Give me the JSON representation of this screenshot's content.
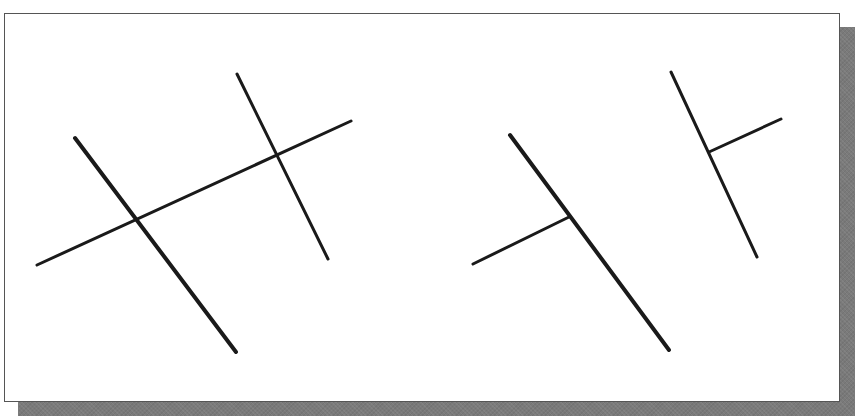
{
  "diagram": {
    "colors": {
      "line": "#1a1a1a",
      "frame_border": "#555555",
      "shadow": "#7a7a7a",
      "background": "#ffffff"
    },
    "left_figure": {
      "lines": [
        {
          "id": "thick-diagonal",
          "x1": 75,
          "y1": 138,
          "x2": 236,
          "y2": 352,
          "width": 4
        },
        {
          "id": "long-shallow",
          "x1": 37,
          "y1": 265,
          "x2": 351,
          "y2": 121,
          "width": 3
        },
        {
          "id": "short-diagonal",
          "x1": 237,
          "y1": 74,
          "x2": 328,
          "y2": 259,
          "width": 3
        }
      ],
      "intersections": [
        {
          "x": 135,
          "y": 219
        },
        {
          "x": 278,
          "y": 156
        }
      ]
    },
    "right_figure": {
      "lines": [
        {
          "id": "thick-diagonal",
          "x1": 510,
          "y1": 135,
          "x2": 669,
          "y2": 350,
          "width": 4
        },
        {
          "id": "lower-branch",
          "x1": 473,
          "y1": 264,
          "x2": 569,
          "y2": 217,
          "width": 3
        },
        {
          "id": "short-diagonal",
          "x1": 671,
          "y1": 72,
          "x2": 757,
          "y2": 257,
          "width": 3
        },
        {
          "id": "upper-branch",
          "x1": 709,
          "y1": 152,
          "x2": 781,
          "y2": 119,
          "width": 3
        }
      ],
      "t_junctions": [
        {
          "x": 569,
          "y": 217
        },
        {
          "x": 709,
          "y": 152
        }
      ]
    }
  }
}
